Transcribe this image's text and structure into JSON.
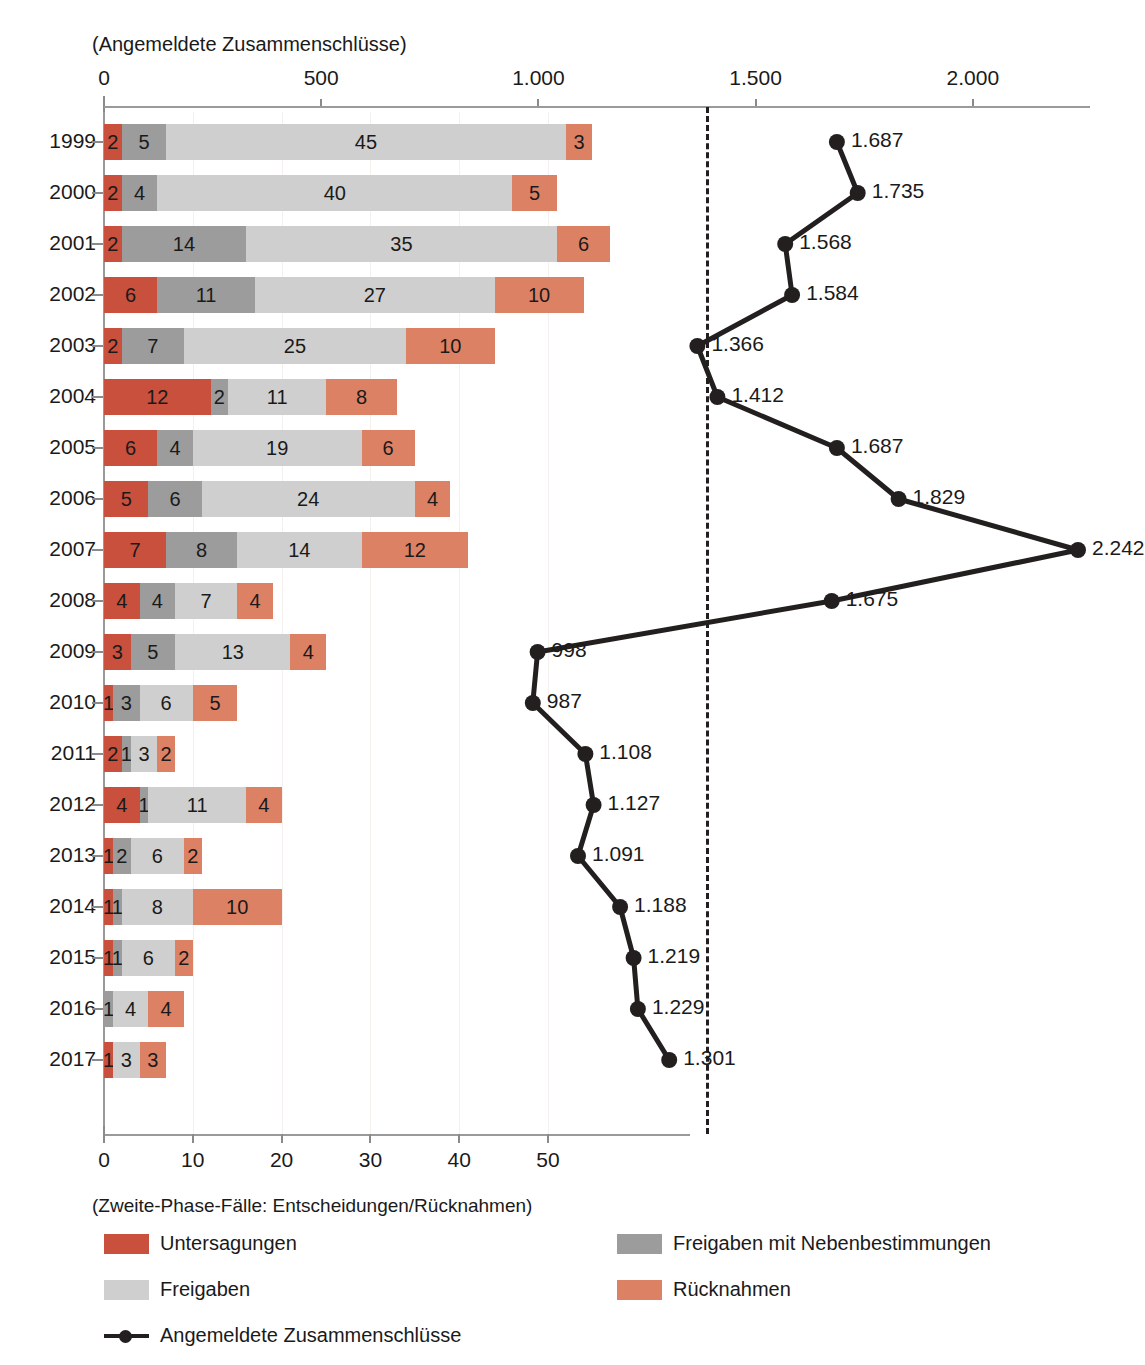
{
  "top_axis": {
    "title": "(Angemeldete Zusammenschlüsse)",
    "ticks": [
      "0",
      "500",
      "1.000",
      "1.500",
      "2.000"
    ]
  },
  "bottom_axis": {
    "title": "(Zweite-Phase-Fälle: Entscheidungen/Rücknahmen)",
    "ticks": [
      "0",
      "10",
      "20",
      "30",
      "40",
      "50"
    ]
  },
  "legend": {
    "items": [
      {
        "label": "Untersagungen",
        "color": "#c8503c",
        "kind": "swatch"
      },
      {
        "label": "Freigaben mit Nebenbestimmungen",
        "color": "#9c9c9c",
        "kind": "swatch"
      },
      {
        "label": "Freigaben",
        "color": "#cfcfcf",
        "kind": "swatch"
      },
      {
        "label": "Rücknahmen",
        "color": "#dd8164",
        "kind": "swatch"
      },
      {
        "label": "Angemeldete Zusammenschlüsse",
        "color": "#231f1e",
        "kind": "line"
      }
    ]
  },
  "chart_data": {
    "type": "bar",
    "title": "",
    "subtitle": "",
    "orientation": "horizontal",
    "stacked": true,
    "xlabel": "(Zweite-Phase-Fälle: Entscheidungen/Rücknahmen)",
    "ylabel": "",
    "secondary_xlabel": "(Angemeldete Zusammenschlüsse)",
    "xlim": [
      0,
      55
    ],
    "secondary_xlim": [
      0,
      2242
    ],
    "grid": false,
    "legend_position": "bottom",
    "reference_line": {
      "value": 1385,
      "axis": "secondary",
      "style": "dashed",
      "color": "#231f1e"
    },
    "categories": [
      "1999",
      "2000",
      "2001",
      "2002",
      "2003",
      "2004",
      "2005",
      "2006",
      "2007",
      "2008",
      "2009",
      "2010",
      "2011",
      "2012",
      "2013",
      "2014",
      "2015",
      "2016",
      "2017"
    ],
    "series": [
      {
        "name": "Untersagungen",
        "color": "#c8503c",
        "values": [
          2,
          2,
          2,
          6,
          2,
          12,
          6,
          5,
          7,
          4,
          3,
          1,
          2,
          4,
          1,
          1,
          1,
          0,
          1
        ]
      },
      {
        "name": "Freigaben mit Nebenbestimmungen",
        "color": "#9c9c9c",
        "values": [
          5,
          4,
          14,
          11,
          7,
          2,
          4,
          6,
          8,
          4,
          5,
          3,
          1,
          1,
          2,
          1,
          1,
          1,
          0
        ]
      },
      {
        "name": "Freigaben",
        "color": "#cfcfcf",
        "values": [
          45,
          40,
          35,
          27,
          25,
          11,
          19,
          24,
          14,
          7,
          13,
          6,
          3,
          11,
          6,
          8,
          6,
          4,
          3
        ]
      },
      {
        "name": "Rücknahmen",
        "color": "#dd8164",
        "values": [
          3,
          5,
          6,
          10,
          10,
          8,
          6,
          4,
          12,
          4,
          4,
          5,
          2,
          4,
          2,
          10,
          2,
          4,
          3
        ]
      }
    ],
    "line_series": {
      "name": "Angemeldete Zusammenschlüsse",
      "color": "#231f1e",
      "axis": "secondary",
      "values": [
        1687,
        1735,
        1568,
        1584,
        1366,
        1412,
        1687,
        1829,
        2242,
        1675,
        998,
        987,
        1108,
        1127,
        1091,
        1188,
        1219,
        1229,
        1301
      ],
      "labels": [
        "1.687",
        "1.735",
        "1.568",
        "1.584",
        "1.366",
        "1.412",
        "1.687",
        "1.829",
        "2.242",
        "1.675",
        "998",
        "987",
        "1.108",
        "1.127",
        "1.091",
        "1.188",
        "1.219",
        "1.229",
        "1.301"
      ]
    }
  }
}
